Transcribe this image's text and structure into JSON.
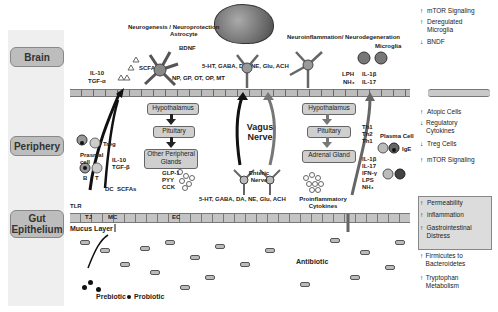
{
  "rows": [
    {
      "label": "Brain"
    },
    {
      "label": "Periphery"
    },
    {
      "label": "Gut Epithelium"
    }
  ],
  "brain": {
    "left_title": "Neurogenesis / Neuroprotection",
    "astrocyte": "Astrocyte",
    "bndf": "BDNF",
    "il10": "IL-10",
    "tgf_a": "TGF-α",
    "scfas": "SCFAs",
    "np_line": "NP, GP, OT, OP, MT",
    "neurotransmitters": "5-HT, GABA, DA, NE, Glu, ACH",
    "right_title": "Neuroinflammation/ Neurodegeneration",
    "microglia": "Microglia",
    "lph": "LPH",
    "nh3": "NH₃",
    "il1b": "IL-1β",
    "il17": "IL-17"
  },
  "periphery": {
    "treg": "Treg",
    "plasma_cell_left": "Prasmal cell",
    "b": "B",
    "t": "T",
    "il10": "IL-10",
    "tgf_b": "TGF-β",
    "dc": "DC",
    "scfas": "SCFAs",
    "hpa_left": [
      "Hypothalamus",
      "Pituitary",
      "Other Peripheral Glands"
    ],
    "hormones": [
      "GLP-1",
      "PYY",
      "CCK"
    ],
    "vagus": "Vagus Nerve",
    "enteric": "Enteric Nerve",
    "gut_nt": "5-HT, GABA, DA, NE, Glu, ACH",
    "hpa_right": [
      "Hypothalamus",
      "Pituitary",
      "Adrenal Gland"
    ],
    "proinflammatory": "Proinflammatory Cytokines",
    "th": [
      "Th1",
      "Th2",
      "Th1"
    ],
    "plasma_cell_right": "Plasma Cell",
    "ige": "IgE",
    "cytokines_right": [
      "IL-1β",
      "IL-17",
      "IFN-γ",
      "LPS",
      "NH₃"
    ]
  },
  "gut": {
    "tlr": "TLR",
    "tj": "TJ",
    "mc": "MC",
    "ec": "EC",
    "mucus": "Mucus Layer",
    "antibiotic": "Antibiotic",
    "prebiotic": "Prebiotic",
    "probiotic": "Probiotic"
  },
  "effects": {
    "brain": [
      {
        "dir": "up",
        "text": "mTOR Signaling"
      },
      {
        "dir": "up",
        "text": "Deregulated Microglia"
      },
      {
        "dir": "down",
        "text": "BNDF"
      }
    ],
    "periphery": [
      {
        "dir": "up",
        "text": "Atopic Cells"
      },
      {
        "dir": "down",
        "text": "Regulatory Cytokines"
      },
      {
        "dir": "down",
        "text": "Treg Cells"
      },
      {
        "dir": "up",
        "text": "mTOR Signaling"
      }
    ],
    "gut_boxed": [
      {
        "dir": "up",
        "text": "Permeability"
      },
      {
        "dir": "up",
        "text": "inflammation"
      },
      {
        "dir": "up",
        "text": "Gastrointestinal Distress"
      }
    ],
    "gut": [
      {
        "dir": "up",
        "text": "Firmicutes to Bacteroidetes"
      },
      {
        "dir": "up",
        "text": "Tryptophan Metabolism"
      }
    ],
    "arrow_up": "↑",
    "arrow_down": "↓"
  }
}
